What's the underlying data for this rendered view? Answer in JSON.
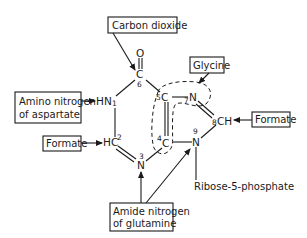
{
  "diagram": {
    "sources": {
      "carbon_dioxide": "Carbon dioxide",
      "glycine": "Glycine",
      "formate_right": "Formate",
      "amino_aspartate_line1": "Amino nitrogen",
      "amino_aspartate_line2": "of aspartate",
      "formate_left": "Formate",
      "amide_glutamine_line1": "Amide nitrogen",
      "amide_glutamine_line2": "of glutamine",
      "ribose": "Ribose-5-phosphate"
    },
    "atoms": {
      "o": "O",
      "c6": "C",
      "c6_num": "6",
      "n1": "HN",
      "n1_num": "1",
      "c2": "HC",
      "c2_num": "2",
      "n3": "N",
      "n3_num": "3",
      "c4": "C",
      "c4_num": "4",
      "c5": "C",
      "c5_num": "5",
      "n7": "N",
      "n7_num": "7",
      "c8": "CH",
      "c8_num": "8",
      "n9": "N",
      "n9_num": "9"
    }
  }
}
